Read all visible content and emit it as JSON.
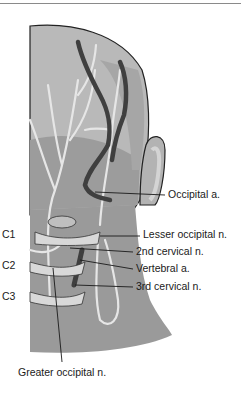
{
  "figure": {
    "colors": {
      "skin_light": "#bdbdbd",
      "skin_mid": "#a3a3a3",
      "skin_dark": "#8c8c8c",
      "vessel": "#4a4a4a",
      "nerve": "#e6e6e6",
      "outline": "#222222"
    }
  },
  "labels": {
    "vertebrae": [
      "C1",
      "C2",
      "C3"
    ],
    "occipital_a": "Occipital a.",
    "lesser_occipital_n": "Lesser occipital n.",
    "second_cervical_n": "2nd cervical n.",
    "vertebral_a": "Vertebral a.",
    "third_cervical_n": "3rd cervical n.",
    "greater_occipital_n": "Greater occipital n."
  }
}
